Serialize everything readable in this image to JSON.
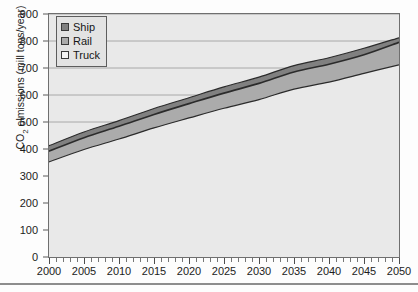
{
  "chart_data": {
    "type": "area",
    "title": "",
    "subtitle": "",
    "xlabel": "",
    "ylabel": "CO2 elmissions (mill tons/year)",
    "ylabel_parts": {
      "prefix": "CO",
      "sub": "2",
      "suffix": " elmissions (mill tons/year)"
    },
    "stacked": true,
    "grid": true,
    "grid_axis": "y",
    "legend_position": "top-left",
    "xlim": [
      2000,
      2050
    ],
    "ylim": [
      0,
      900
    ],
    "x": [
      2000,
      2005,
      2010,
      2015,
      2020,
      2025,
      2030,
      2035,
      2040,
      2045,
      2050
    ],
    "categories": [
      "2000",
      "2005",
      "2010",
      "2015",
      "2020",
      "2025",
      "2030",
      "2035",
      "2040",
      "2045",
      "2050"
    ],
    "x_tick_labels": [
      "2000",
      "2005",
      "2010",
      "2015",
      "2020",
      "2025",
      "2030",
      "2035",
      "2040",
      "2045",
      "2050"
    ],
    "x_minor_tick_interval": 1,
    "y_tick_labels": [
      "0",
      "100",
      "200",
      "300",
      "400",
      "500",
      "600",
      "700",
      "800",
      "900"
    ],
    "y_ticks": [
      0,
      100,
      200,
      300,
      400,
      500,
      600,
      700,
      800,
      900
    ],
    "series": [
      {
        "name": "Truck",
        "color": "#e9e9e9",
        "stack_order": 1,
        "values": [
          352,
          398,
          437,
          478,
          515,
          551,
          583,
          622,
          648,
          680,
          712
        ]
      },
      {
        "name": "Rail",
        "color": "#ababab",
        "stack_order": 2,
        "values": [
          40,
          44,
          47,
          50,
          53,
          56,
          60,
          63,
          66,
          69,
          83
        ]
      },
      {
        "name": "Ship",
        "color": "#808080",
        "stack_order": 3,
        "values": [
          20,
          21,
          21,
          22,
          22,
          23,
          23,
          24,
          24,
          24,
          17
        ]
      }
    ],
    "cumulative": {
      "truck_top": [
        352,
        398,
        437,
        478,
        515,
        551,
        583,
        622,
        648,
        680,
        712
      ],
      "rail_top": [
        392,
        442,
        484,
        528,
        568,
        607,
        643,
        685,
        714,
        749,
        795
      ],
      "ship_top": [
        412,
        463,
        505,
        550,
        590,
        630,
        666,
        709,
        738,
        773,
        812
      ]
    },
    "legend": [
      {
        "label": "Ship",
        "color": "#808080"
      },
      {
        "label": "Rail",
        "color": "#ababab"
      },
      {
        "label": "Truck",
        "color": "#f4f4f4"
      }
    ]
  },
  "colors": {
    "plot_background": "#e9e9e9",
    "figure_background": "#fdfdfd",
    "axis_line": "#6f6f6f",
    "gridline": "#a8a8a8",
    "series_outline": "#2b2b2b",
    "ship": "#808080",
    "rail": "#ababab",
    "truck": "#e9e9e9",
    "text": "#1c1c1c"
  }
}
